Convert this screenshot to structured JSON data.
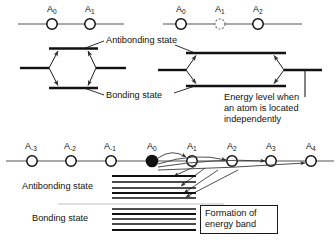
{
  "figure": {
    "colors": {
      "line": "#1a1a1a",
      "chain": "#4d4d4d",
      "arrow": "#3a3a3a",
      "band": "#111111",
      "background": "#ffffff"
    }
  },
  "panel_two_atom": {
    "chain": {
      "atoms": [
        {
          "label": "A",
          "sub": "0",
          "x": 52,
          "y": 24,
          "filled": false,
          "dashed": false
        },
        {
          "label": "A",
          "sub": "1",
          "x": 90,
          "y": 24,
          "filled": false,
          "dashed": false
        }
      ],
      "line_x1": 18,
      "line_x2": 124,
      "line_y": 24
    },
    "levels": {
      "antibonding_y": 49,
      "bonding_y": 88,
      "mid_y": 68,
      "left_x1": 20,
      "left_x2": 48,
      "right_x1": 97,
      "right_x2": 125,
      "center_x1": 49,
      "center_x2": 96
    },
    "callouts": {
      "antibonding": "Antibonding state",
      "bonding": "Bonding state"
    }
  },
  "panel_three_atom": {
    "chain": {
      "atoms": [
        {
          "label": "A",
          "sub": "0",
          "x": 181,
          "y": 24,
          "filled": false,
          "dashed": false
        },
        {
          "label": "A",
          "sub": "1",
          "x": 220,
          "y": 24,
          "filled": false,
          "dashed": true
        },
        {
          "label": "A",
          "sub": "2",
          "x": 258,
          "y": 24,
          "filled": false,
          "dashed": false
        }
      ],
      "line_x1": 163,
      "line_x2": 300,
      "line_y": 24
    },
    "levels": {
      "antibonding_y": 53,
      "bonding_y": 86,
      "mid_y": 70,
      "left_x1": 160,
      "left_x2": 185,
      "right_x1": 285,
      "right_x2": 320,
      "center_x1": 186,
      "center_x2": 284
    },
    "reference_tick": {
      "x": 305,
      "y1": 70,
      "y2": 97
    },
    "note": {
      "line1": "Energy level when",
      "line2": "an atom is located",
      "line3": "independently"
    }
  },
  "panel_band": {
    "chain": {
      "atoms": [
        {
          "label": "A",
          "sub": "-3",
          "x": 32,
          "y": 161,
          "filled": false,
          "dashed": false
        },
        {
          "label": "A",
          "sub": "-2",
          "x": 71,
          "y": 161,
          "filled": false,
          "dashed": false
        },
        {
          "label": "A",
          "sub": "-1",
          "x": 111,
          "y": 161,
          "filled": false,
          "dashed": false
        },
        {
          "label": "A",
          "sub": "0",
          "x": 152,
          "y": 161,
          "filled": true,
          "dashed": false
        },
        {
          "label": "A",
          "sub": "1",
          "x": 192,
          "y": 161,
          "filled": false,
          "dashed": false
        },
        {
          "label": "A",
          "sub": "2",
          "x": 232,
          "y": 161,
          "filled": false,
          "dashed": false
        },
        {
          "label": "A",
          "sub": "3",
          "x": 271,
          "y": 161,
          "filled": false,
          "dashed": false
        },
        {
          "label": "A",
          "sub": "4",
          "x": 311,
          "y": 161,
          "filled": false,
          "dashed": false
        }
      ],
      "line_x1": 6,
      "line_x2": 334,
      "line_y": 161
    },
    "antibonding_band": {
      "label": "Antibonding state",
      "x1": 112,
      "x2": 196,
      "levels_y": [
        176,
        182,
        188,
        193,
        198
      ]
    },
    "bonding_band": {
      "label": "Bonding state",
      "x1": 112,
      "x2": 196,
      "levels_y": [
        209,
        214,
        219,
        224,
        230
      ]
    },
    "reference_line": {
      "y": 204,
      "x1": 58,
      "x2": 224
    },
    "callout_box": {
      "line1": "Formation of",
      "line2": "energy band",
      "x": 200,
      "y": 205,
      "width": 68,
      "height": 28
    }
  }
}
